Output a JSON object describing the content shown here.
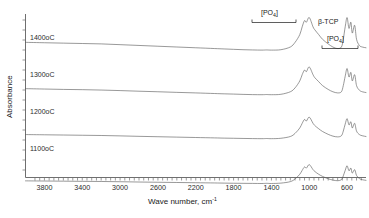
{
  "figure": {
    "type": "ftir-spectra",
    "background": "#ffffff",
    "curve_color": "#5a5a5a",
    "axis_color": "#6f6f6f"
  },
  "axes": {
    "y_title": "Absorbance",
    "x_title_main": "Wave number, cm",
    "x_title_sup": "-1",
    "x_ticks": [
      "3800",
      "3400",
      "3000",
      "2600",
      "2200",
      "1800",
      "1400",
      "1000",
      "600"
    ],
    "x_min": 4000,
    "x_max": 400,
    "x_direction": "reversed",
    "y_ticks_visible": false
  },
  "annotations": {
    "po4_v3_label_open": "[PO",
    "po4_v3_label_sub": "4",
    "po4_v3_label_close": "]",
    "btcp_label": "β-TCP",
    "po4_v4_label_open": "[PO",
    "po4_v4_label_sub": "4",
    "po4_v4_label_close": "]"
  },
  "curves": [
    {
      "name": "1400oC",
      "label": "1400oC"
    },
    {
      "name": "1300oC",
      "label": "1300oC"
    },
    {
      "name": "1200oC",
      "label": "1200oC"
    },
    {
      "name": "1100oC",
      "label": "1100oC"
    }
  ],
  "chart_data": {
    "type": "line",
    "title": "",
    "xlabel": "Wave number, cm-1",
    "ylabel": "Absorbance",
    "xlim": [
      4000,
      400
    ],
    "ylim": [
      0,
      1
    ],
    "grid": false,
    "legend": "inline-left-labels",
    "axis_note": "x axis reversed (high wavenumber on left); y axis arbitrary absorbance units, curves offset vertically",
    "xticks": [
      3800,
      3400,
      3000,
      2600,
      2200,
      1800,
      1400,
      1000,
      600
    ],
    "annotations": [
      {
        "text": "[PO4]",
        "wavenumber_range": [
          1200,
          900
        ],
        "note": "v3 PO4 broad band bracket, top curve"
      },
      {
        "text": "b-TCP",
        "wavenumber": 800,
        "note": "beta tricalcium phosphate phase label"
      },
      {
        "text": "[PO4]",
        "wavenumber_range": [
          650,
          520
        ],
        "note": "v4 PO4 sharp split band bracket"
      }
    ],
    "series": [
      {
        "name": "1400oC",
        "offset_index": 0,
        "x": [
          4000,
          3800,
          3600,
          3400,
          3200,
          3000,
          2800,
          2600,
          2400,
          2200,
          2000,
          1900,
          1800,
          1700,
          1600,
          1500,
          1450,
          1400,
          1300,
          1200,
          1150,
          1100,
          1075,
          1050,
          1030,
          1000,
          960,
          940,
          900,
          860,
          800,
          750,
          700,
          660,
          640,
          620,
          600,
          580,
          560,
          545,
          520,
          500,
          470,
          440,
          400
        ],
        "y": [
          0.46,
          0.455,
          0.45,
          0.445,
          0.44,
          0.43,
          0.42,
          0.41,
          0.4,
          0.39,
          0.38,
          0.375,
          0.37,
          0.365,
          0.362,
          0.36,
          0.362,
          0.36,
          0.365,
          0.4,
          0.46,
          0.56,
          0.66,
          0.74,
          0.72,
          0.78,
          0.66,
          0.62,
          0.56,
          0.5,
          0.44,
          0.4,
          0.38,
          0.4,
          0.5,
          0.66,
          0.78,
          0.64,
          0.72,
          0.58,
          0.68,
          0.5,
          0.42,
          0.4,
          0.39
        ]
      },
      {
        "name": "1300oC",
        "offset_index": 1,
        "x": [
          4000,
          3800,
          3600,
          3400,
          3200,
          3000,
          2800,
          2600,
          2400,
          2200,
          2000,
          1900,
          1800,
          1700,
          1600,
          1500,
          1450,
          1400,
          1300,
          1200,
          1150,
          1100,
          1075,
          1050,
          1030,
          1000,
          960,
          940,
          900,
          860,
          800,
          750,
          700,
          660,
          640,
          620,
          600,
          580,
          560,
          545,
          520,
          500,
          470,
          440,
          400
        ],
        "y": [
          0.34,
          0.335,
          0.33,
          0.327,
          0.322,
          0.315,
          0.307,
          0.3,
          0.292,
          0.285,
          0.277,
          0.273,
          0.27,
          0.266,
          0.263,
          0.262,
          0.264,
          0.262,
          0.267,
          0.3,
          0.35,
          0.44,
          0.52,
          0.58,
          0.56,
          0.62,
          0.52,
          0.48,
          0.43,
          0.38,
          0.33,
          0.3,
          0.285,
          0.3,
          0.38,
          0.5,
          0.6,
          0.49,
          0.55,
          0.44,
          0.52,
          0.38,
          0.32,
          0.3,
          0.29
        ]
      },
      {
        "name": "1200oC",
        "offset_index": 2,
        "x": [
          4000,
          3800,
          3600,
          3400,
          3200,
          3000,
          2800,
          2600,
          2400,
          2200,
          2000,
          1900,
          1800,
          1700,
          1600,
          1500,
          1450,
          1400,
          1300,
          1200,
          1150,
          1100,
          1075,
          1050,
          1030,
          1000,
          960,
          940,
          900,
          860,
          800,
          750,
          700,
          660,
          640,
          620,
          600,
          580,
          560,
          545,
          520,
          500,
          470,
          440,
          400
        ],
        "y": [
          0.225,
          0.222,
          0.219,
          0.216,
          0.213,
          0.208,
          0.202,
          0.197,
          0.192,
          0.187,
          0.182,
          0.179,
          0.177,
          0.175,
          0.173,
          0.172,
          0.174,
          0.172,
          0.177,
          0.2,
          0.24,
          0.31,
          0.37,
          0.42,
          0.4,
          0.45,
          0.37,
          0.34,
          0.3,
          0.265,
          0.228,
          0.205,
          0.195,
          0.21,
          0.27,
          0.36,
          0.43,
          0.35,
          0.39,
          0.31,
          0.37,
          0.27,
          0.225,
          0.21,
          0.2
        ]
      },
      {
        "name": "1100oC",
        "offset_index": 3,
        "x": [
          4000,
          3800,
          3600,
          3400,
          3200,
          3000,
          2800,
          2600,
          2400,
          2200,
          2000,
          1900,
          1800,
          1700,
          1600,
          1500,
          1450,
          1400,
          1300,
          1200,
          1150,
          1100,
          1075,
          1050,
          1030,
          1000,
          960,
          940,
          900,
          860,
          800,
          750,
          700,
          660,
          640,
          620,
          600,
          580,
          560,
          545,
          520,
          500,
          470,
          440,
          400
        ],
        "y": [
          0.105,
          0.103,
          0.101,
          0.099,
          0.097,
          0.094,
          0.09,
          0.087,
          0.084,
          0.081,
          0.078,
          0.076,
          0.074,
          0.073,
          0.072,
          0.071,
          0.073,
          0.071,
          0.076,
          0.095,
          0.13,
          0.19,
          0.24,
          0.285,
          0.27,
          0.315,
          0.25,
          0.225,
          0.19,
          0.163,
          0.132,
          0.115,
          0.107,
          0.12,
          0.17,
          0.24,
          0.3,
          0.235,
          0.27,
          0.205,
          0.25,
          0.175,
          0.135,
          0.12,
          0.112
        ]
      }
    ]
  }
}
